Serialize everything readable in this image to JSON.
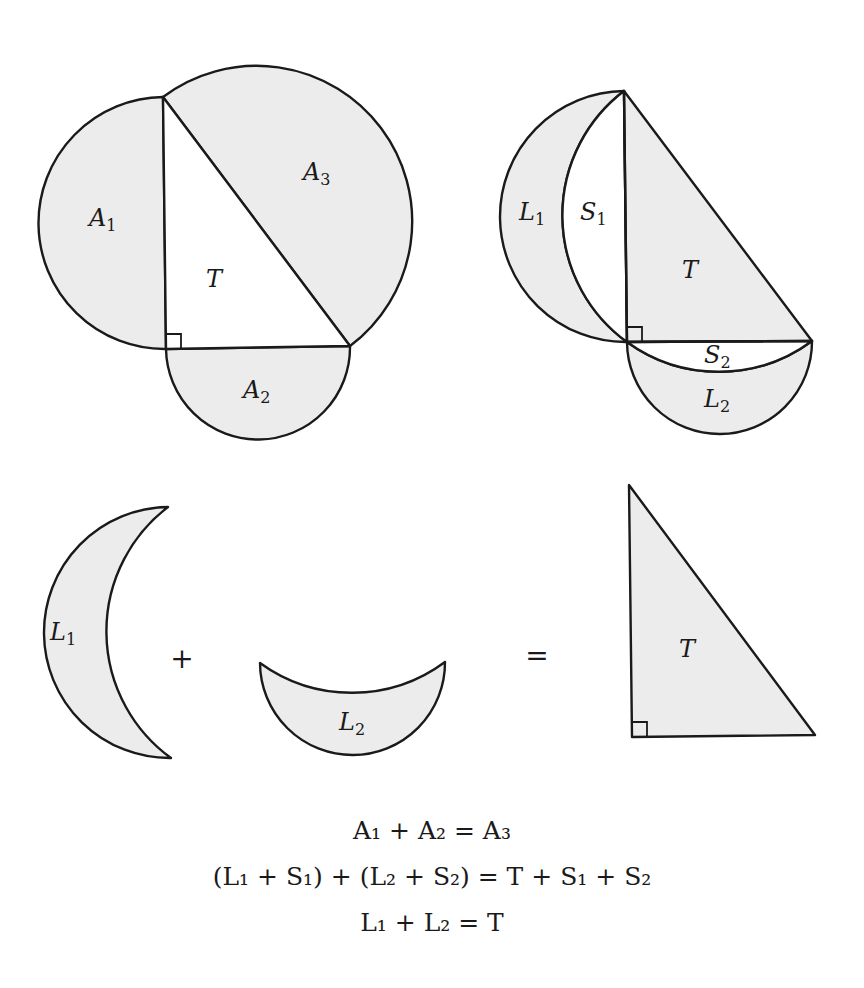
{
  "figure": {
    "colors": {
      "fill": "#ececec",
      "stroke": "#1a1a1a",
      "background": "#ffffff"
    },
    "top_left": {
      "labels": {
        "a1": {
          "var": "A",
          "sub": "1"
        },
        "a2": {
          "var": "A",
          "sub": "2"
        },
        "a3": {
          "var": "A",
          "sub": "3"
        },
        "t": {
          "var": "T",
          "sub": ""
        }
      }
    },
    "top_right": {
      "labels": {
        "l1": {
          "var": "L",
          "sub": "1"
        },
        "s1": {
          "var": "S",
          "sub": "1"
        },
        "t": {
          "var": "T",
          "sub": ""
        },
        "s2": {
          "var": "S",
          "sub": "2"
        },
        "l2": {
          "var": "L",
          "sub": "2"
        }
      }
    },
    "bottom_row": {
      "l1": {
        "var": "L",
        "sub": "1"
      },
      "plus": "+",
      "l2": {
        "var": "L",
        "sub": "2"
      },
      "equals": "=",
      "t": {
        "var": "T",
        "sub": ""
      }
    },
    "equations": [
      "A₁ + A₂ = A₃",
      "(L₁ + S₁) + (L₂ + S₂) = T + S₁ + S₂",
      "L₁ + L₂ = T"
    ]
  }
}
